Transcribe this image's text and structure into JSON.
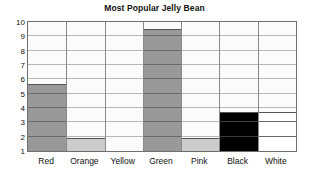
{
  "chart_data": {
    "type": "bar",
    "title": "Most Popular Jelly Bean",
    "xlabel": "",
    "ylabel": "",
    "categories": [
      "Red",
      "Orange",
      "Yellow",
      "Green",
      "Pink",
      "Black",
      "White"
    ],
    "values": [
      5.7,
      1.9,
      1.0,
      9.5,
      1.9,
      3.7,
      3.7
    ],
    "bar_colors": [
      "#999999",
      "#cccccc",
      "#fbfbfb",
      "#999999",
      "#cccccc",
      "#000000",
      "#ffffff"
    ],
    "ylim": [
      1,
      10
    ],
    "yticks": [
      1,
      2,
      3,
      4,
      5,
      6,
      7,
      8,
      9,
      10
    ],
    "ytick_labels": [
      "1",
      "2",
      "3",
      "4",
      "5",
      "6",
      "7",
      "8",
      "9",
      "10"
    ],
    "grid": true,
    "legend": false,
    "frame_color": "#6e6e6e",
    "grid_color": "#b8b8b8",
    "plot_background": "#fbfbfb"
  }
}
